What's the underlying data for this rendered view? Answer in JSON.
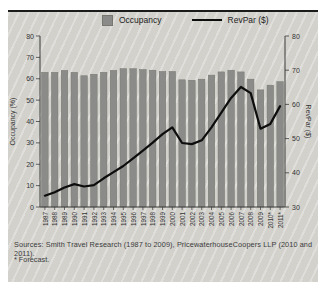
{
  "legend": {
    "occupancy_label": "Occupancy",
    "revpar_label": "RevPar ($)"
  },
  "footer": {
    "sources": "Sources: Smith Travel Research (1987 to 2009), PricewaterhouseCoopers LLP (2010 and 2011).",
    "forecast_note": "* Forecast."
  },
  "colors": {
    "panel_bg": "#d6d5d0",
    "bar": "#8b8b89",
    "bar_edge": "#77776f",
    "line": "#0d0d0d",
    "axis": "#3b3b3b",
    "tick_text": "#333333",
    "top_border": "#1b1b1b"
  },
  "chart_data": {
    "type": "bar+line",
    "title": "",
    "categories": [
      "1987",
      "1988",
      "1989",
      "1990",
      "1991",
      "1992",
      "1993",
      "1994",
      "1995",
      "1996",
      "1997",
      "1998",
      "1999",
      "2000",
      "2001",
      "2002",
      "2003",
      "2004",
      "2005",
      "2006",
      "2007",
      "2008",
      "2009",
      "2010*",
      "2011*"
    ],
    "series": [
      {
        "name": "Occupancy",
        "type": "bar",
        "axis": "left",
        "values": [
          63.0,
          63.0,
          63.9,
          63.0,
          61.4,
          62.1,
          63.0,
          63.9,
          64.7,
          64.7,
          64.3,
          64.0,
          63.4,
          63.4,
          59.5,
          59.3,
          59.8,
          61.7,
          63.2,
          64.0,
          63.2,
          59.8,
          54.8,
          57.0,
          58.6
        ]
      },
      {
        "name": "RevPar ($)",
        "type": "line",
        "axis": "right",
        "values": [
          33.3,
          34.3,
          35.7,
          36.7,
          36.0,
          36.4,
          38.4,
          40.2,
          42.0,
          44.2,
          46.5,
          48.8,
          51.3,
          53.3,
          48.7,
          48.4,
          49.5,
          53.3,
          57.6,
          61.9,
          65.1,
          63.3,
          52.9,
          54.3,
          59.5
        ]
      }
    ],
    "left_axis": {
      "label": "Occupancy (%)",
      "min": 0,
      "max": 80,
      "tick_step": 10
    },
    "right_axis": {
      "label": "RevPar ($)",
      "min": 30,
      "max": 80,
      "tick_step": 10
    },
    "legend_position": "top",
    "grid": false,
    "footnote_marker_years": [
      "2010*",
      "2011*"
    ]
  }
}
